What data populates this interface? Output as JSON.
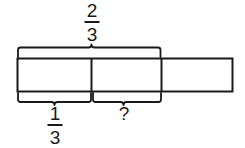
{
  "diagram": {
    "type": "tape-diagram",
    "title": "",
    "background_color": "#ffffff",
    "stroke_color": "#1a1a1a",
    "bar": {
      "x": 17,
      "y": 58,
      "width": 216,
      "height": 34,
      "cell_count": 3,
      "divider_x": [
        91,
        161
      ],
      "cells": [
        {
          "index": 1,
          "label": "",
          "shaded": false
        },
        {
          "index": 2,
          "label": "",
          "shaded": false
        },
        {
          "index": 3,
          "label": "",
          "shaded": false
        }
      ]
    },
    "top_brace": {
      "name": "two-thirds-brace",
      "start_x": 17,
      "end_x": 161,
      "spans_cells": 2,
      "label": {
        "kind": "fraction",
        "numerator": "2",
        "denominator": "3",
        "text": "2/3",
        "center_x": 92,
        "center_y": 22
      }
    },
    "bottom_braces": [
      {
        "name": "one-third-brace",
        "start_x": 17,
        "end_x": 91,
        "spans_cells": 1,
        "label": {
          "kind": "fraction",
          "numerator": "1",
          "denominator": "3",
          "text": "1/3",
          "center_x": 55,
          "center_y": 125
        }
      },
      {
        "name": "unknown-brace",
        "start_x": 92,
        "end_x": 161,
        "spans_cells": 1,
        "label": {
          "kind": "text",
          "text": "?",
          "center_x": 124,
          "center_y": 113
        }
      }
    ]
  }
}
